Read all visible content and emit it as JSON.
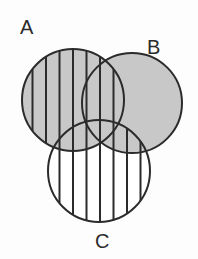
{
  "figure": {
    "type": "venn-diagram",
    "title": "",
    "background_color": "#fdfdfd",
    "width": 198,
    "height": 259
  },
  "style": {
    "stroke_color": "#2b2b2b",
    "stroke_width": 2,
    "gray_fill": "#c8c8c8",
    "white_fill": "#ffffff",
    "hatch_color": "#2b2b2b",
    "hatch_width": 2,
    "hatch_spacing": 13.5,
    "hatch_orientation": "vertical",
    "label_color": "#2b2b2b",
    "label_font_size": "20px"
  },
  "sets": [
    {
      "id": "A",
      "label": "A",
      "cx": 73,
      "cy": 100,
      "r": 51,
      "fill": "gray",
      "hatched": true,
      "label_x": 20,
      "label_y": 17
    },
    {
      "id": "B",
      "label": "B",
      "cx": 132,
      "cy": 103,
      "r": 50,
      "fill": "gray",
      "hatched": false,
      "label_x": 147,
      "label_y": 37
    },
    {
      "id": "C",
      "label": "C",
      "cx": 99,
      "cy": 171,
      "r": 51,
      "fill": "white",
      "hatched": true,
      "label_x": 95,
      "label_y": 231
    }
  ],
  "regions": [
    {
      "id": "A-only",
      "sets": [
        "A"
      ],
      "fill": "gray",
      "hatched": true
    },
    {
      "id": "B-only",
      "sets": [
        "B"
      ],
      "fill": "gray",
      "hatched": false
    },
    {
      "id": "C-only",
      "sets": [
        "C"
      ],
      "fill": "white",
      "hatched": true
    },
    {
      "id": "A-and-B",
      "sets": [
        "A",
        "B"
      ],
      "fill": "gray",
      "hatched": true
    },
    {
      "id": "A-and-C",
      "sets": [
        "A",
        "C"
      ],
      "fill": "gray",
      "hatched": true
    },
    {
      "id": "B-and-C",
      "sets": [
        "B",
        "C"
      ],
      "fill": "gray",
      "hatched": true
    },
    {
      "id": "A-and-B-and-C",
      "sets": [
        "A",
        "B",
        "C"
      ],
      "fill": "gray",
      "hatched": true
    }
  ],
  "chart_data": {
    "type": "venn",
    "title": "",
    "categories": [
      "A",
      "B",
      "C"
    ],
    "circles": [
      {
        "label": "A",
        "cx": 73,
        "cy": 100,
        "r": 51
      },
      {
        "label": "B",
        "cx": 132,
        "cy": 103,
        "r": 50
      },
      {
        "label": "C",
        "cx": 99,
        "cy": 171,
        "r": 51
      }
    ],
    "shading": {
      "gray_sets": [
        "A",
        "B"
      ],
      "hatched_sets": [
        "A",
        "C"
      ],
      "unshaded_sets": []
    },
    "legend_position": "none",
    "grid": false
  }
}
